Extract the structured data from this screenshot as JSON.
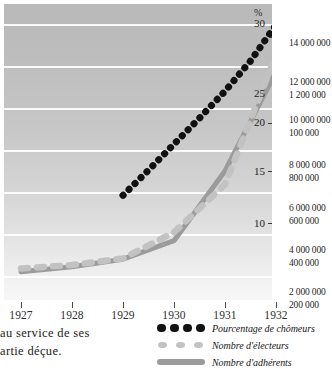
{
  "chart_data": {
    "type": "line",
    "title": "",
    "xlabel": "",
    "ylabel": "%",
    "categories": [
      "1927",
      "1928",
      "1929",
      "1930",
      "1931",
      "1932"
    ],
    "x": [
      1927,
      1928,
      1929,
      1930,
      1931,
      1932
    ],
    "grid": true,
    "legend_position": "bottom-right",
    "percent_axis": {
      "unit_label": "%",
      "side": "right",
      "ticks": [
        10,
        15,
        20,
        25,
        30
      ],
      "tick_labels": [
        "10",
        "15",
        "20",
        "25",
        "30"
      ],
      "range": [
        0,
        31.5
      ]
    },
    "right_axis_labels": [
      {
        "upper": "14 000 000",
        "lower": ""
      },
      {
        "upper": "12 000 000",
        "lower": "1 200 000"
      },
      {
        "upper": "10 000 000",
        "lower": "100 000"
      },
      {
        "upper": "8 000 000",
        "lower": "800 000"
      },
      {
        "upper": "6 000 000",
        "lower": "600 000"
      },
      {
        "upper": "4 000 000",
        "lower": "400 000"
      },
      {
        "upper": "2 000 000",
        "lower": "200 000"
      }
    ],
    "series": [
      {
        "name": "Pourcentage de chômeurs",
        "style": "dotted",
        "color": "#111111",
        "x": [
          1929.0,
          1929.5,
          1930.0,
          1930.5,
          1931.0,
          1931.5,
          1932.0
        ],
        "values": [
          9.6,
          12.6,
          15.7,
          18.8,
          22.0,
          25.6,
          29.9
        ]
      },
      {
        "name": "Nombre d'électeurs",
        "style": "dashed",
        "color": "#c2c2c2",
        "x": [
          1927,
          1928,
          1929,
          1930,
          1931,
          1932
        ],
        "values": [
          0.9,
          1.3,
          2.1,
          5.2,
          10.9,
          26.3
        ]
      },
      {
        "name": "Nombre d'adhérents",
        "style": "solid",
        "color": "#9b9b9b",
        "x": [
          1927,
          1928,
          1929,
          1930,
          1931,
          1932
        ],
        "values": [
          0.5,
          1.1,
          2.0,
          4.2,
          12.5,
          24.3
        ]
      }
    ]
  },
  "axis": {
    "percent_unit": "%",
    "percent_ticks": [
      "30",
      "25",
      "20",
      "15",
      "10"
    ],
    "x_labels": [
      "1927",
      "1928",
      "1929",
      "1930",
      "1931",
      "1932"
    ]
  },
  "right_values": [
    "14 000 000",
    "12 000 000",
    "1 200 000",
    "10 000 000",
    "100 000",
    "8 000 000",
    "800 000",
    "6 000 000",
    "600 000",
    "4 000 000",
    "400 000",
    "2 000 000",
    "200 000"
  ],
  "legend": {
    "items": [
      {
        "label": "Pourcentage de chômeurs",
        "marker": "dotted-black",
        "color": "#111111"
      },
      {
        "label": "Nombre d'électeurs",
        "marker": "dotted-light",
        "color": "#c2c2c2"
      },
      {
        "label": "Nombre d'adhérents",
        "marker": "solid-gray",
        "color": "#9b9b9b"
      }
    ]
  },
  "page_text": {
    "line1": "au service de ses",
    "line2": "artie déçue."
  },
  "colors": {
    "plot_bg_top": "#b9b9b9",
    "plot_bg_bottom": "#f7f7f7",
    "gridline": "#ffffff",
    "chomeurs": "#111111",
    "electeurs": "#c2c2c2",
    "adherents": "#9b9b9b",
    "text": "#1c1c1c"
  }
}
